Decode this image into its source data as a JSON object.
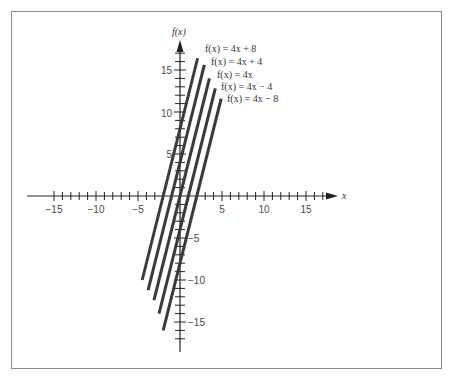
{
  "chart_data": {
    "type": "line",
    "title": "",
    "xlabel": "x",
    "ylabel": "f(x)",
    "xlim": [
      -17,
      18
    ],
    "ylim": [
      -18,
      18
    ],
    "grid": false,
    "x_ticks": [
      -15,
      -10,
      -5,
      5,
      10,
      15
    ],
    "y_ticks": [
      -15,
      -10,
      -5,
      5,
      10,
      15
    ],
    "minor_tick_step": 1,
    "legend_position": "inline-top-right-of-lines",
    "series": [
      {
        "name": "f(x) = 4x + 8",
        "slope": 4,
        "intercept": 8,
        "x": [
          -4.5,
          2.1
        ],
        "y": [
          -10,
          16.4
        ]
      },
      {
        "name": "f(x) = 4x + 4",
        "slope": 4,
        "intercept": 4,
        "x": [
          -3.8,
          2.9
        ],
        "y": [
          -11.2,
          15.6
        ]
      },
      {
        "name": "f(x) = 4x",
        "slope": 4,
        "intercept": 0,
        "x": [
          -3.1,
          3.5
        ],
        "y": [
          -12.4,
          14
        ]
      },
      {
        "name": "f(x) = 4x − 4",
        "slope": 4,
        "intercept": -4,
        "x": [
          -2.5,
          4.2
        ],
        "y": [
          -14,
          12.8
        ]
      },
      {
        "name": "f(x) = 4x − 8",
        "slope": 4,
        "intercept": -8,
        "x": [
          -2,
          4.9
        ],
        "y": [
          -16,
          11.6
        ]
      }
    ]
  },
  "labels": {
    "x_axis": "x",
    "y_axis": "f(x)",
    "x_ticks": [
      "−15",
      "−10",
      "−5",
      "5",
      "10",
      "15"
    ],
    "y_ticks": [
      "15",
      "10",
      "5",
      "−5",
      "−10",
      "−15"
    ],
    "legend": [
      "f(x) = 4x + 8",
      "f(x) = 4x + 4",
      "f(x) = 4x",
      "f(x) = 4x − 4",
      "f(x) = 4x − 8"
    ]
  }
}
